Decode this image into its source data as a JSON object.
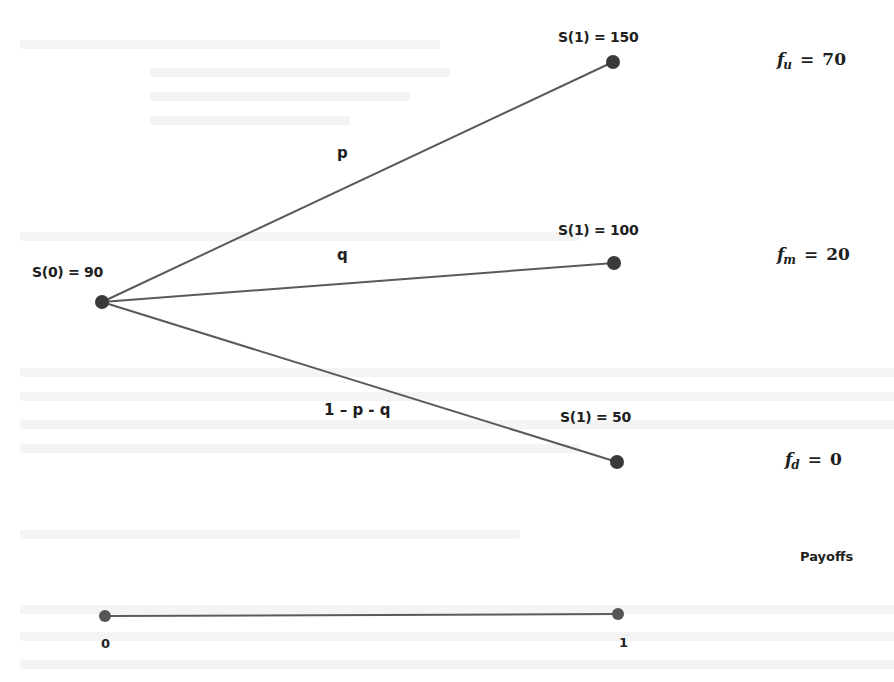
{
  "diagram": {
    "type": "trinomial-tree",
    "root": {
      "label": "S(0) = 90",
      "value": 90
    },
    "branches": [
      {
        "id": "up",
        "probability_label": "p",
        "node_label": "S(1) = 150",
        "value": 150,
        "payoff": {
          "symbol": "f",
          "subscript": "u",
          "equals": "=",
          "value": "70"
        }
      },
      {
        "id": "middle",
        "probability_label": "q",
        "node_label": "S(1) = 100",
        "value": 100,
        "payoff": {
          "symbol": "f",
          "subscript": "m",
          "equals": "=",
          "value": "20"
        }
      },
      {
        "id": "down",
        "probability_label": "1 – p - q",
        "node_label": "S(1) = 50",
        "value": 50,
        "payoff": {
          "symbol": "f",
          "subscript": "d",
          "equals": "=",
          "value": "0"
        }
      }
    ],
    "payoffs_caption": "Payoffs",
    "timeline": {
      "start_label": "0",
      "end_label": "1"
    }
  },
  "colors": {
    "line": "#5a5a5a",
    "node": "#3a3a3a",
    "text": "#1e1e1e",
    "background": "#ffffff"
  }
}
